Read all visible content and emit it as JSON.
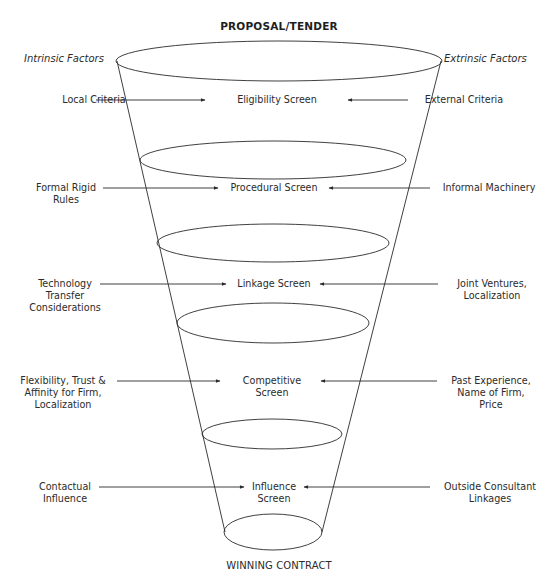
{
  "title": "PROPOSAL/TENDER",
  "footer": "WINNING CONTRACT",
  "headers": {
    "left": "Intrinsic Factors",
    "right": "Extrinsic Factors"
  },
  "screens": [
    {
      "name": "Eligibility Screen",
      "center_lines": [
        "Eligibility Screen"
      ],
      "left_lines": [
        "Local Criteria"
      ],
      "right_lines": [
        "External Criteria"
      ]
    },
    {
      "name": "Procedural Screen",
      "center_lines": [
        "Procedural Screen"
      ],
      "left_lines": [
        "Formal Rigid",
        "Rules"
      ],
      "right_lines": [
        "Informal Machinery"
      ]
    },
    {
      "name": "Linkage Screen",
      "center_lines": [
        "Linkage Screen"
      ],
      "left_lines": [
        "Technology",
        "Transfer",
        "Considerations"
      ],
      "right_lines": [
        "Joint Ventures,",
        "Localization"
      ]
    },
    {
      "name": "Competitive Screen",
      "center_lines": [
        "Competitive",
        "Screen"
      ],
      "left_lines": [
        "Flexibility, Trust &",
        "Affinity for Firm,",
        "Localization"
      ],
      "right_lines": [
        "Past Experience,",
        "Name of Firm,",
        "Price"
      ]
    },
    {
      "name": "Influence Screen",
      "center_lines": [
        "Influence",
        "Screen"
      ],
      "left_lines": [
        "Contactual",
        "Influence"
      ],
      "right_lines": [
        "Outside Consultant",
        "Linkages"
      ]
    }
  ],
  "colors": {
    "stroke": "#2a2a2a",
    "text": "#2b2b2b",
    "background": "#ffffff"
  }
}
